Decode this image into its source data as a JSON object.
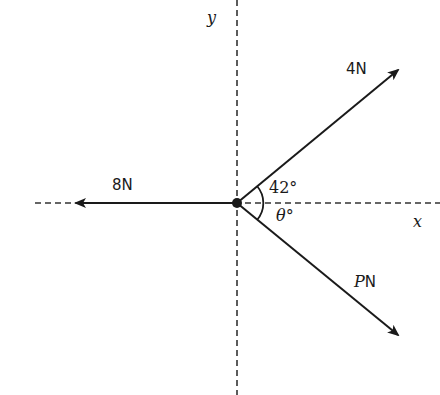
{
  "diagram": {
    "type": "force diagram",
    "axes": {
      "x_label": "x",
      "y_label": "y"
    },
    "forces": [
      {
        "label": "4N",
        "magnitude": "4",
        "unit": "N",
        "direction": "42° above positive x-axis"
      },
      {
        "label": "8N",
        "magnitude": "8",
        "unit": "N",
        "direction": "along negative x-axis"
      },
      {
        "label_var": "P",
        "label_unit": "N",
        "magnitude": "P",
        "unit": "N",
        "direction": "θ° below positive x-axis"
      }
    ],
    "angles": [
      {
        "label": "42°",
        "between": "4N force and positive x-axis"
      },
      {
        "label_var": "θ",
        "label_deg": "°",
        "between": "P N force and positive x-axis"
      }
    ]
  }
}
